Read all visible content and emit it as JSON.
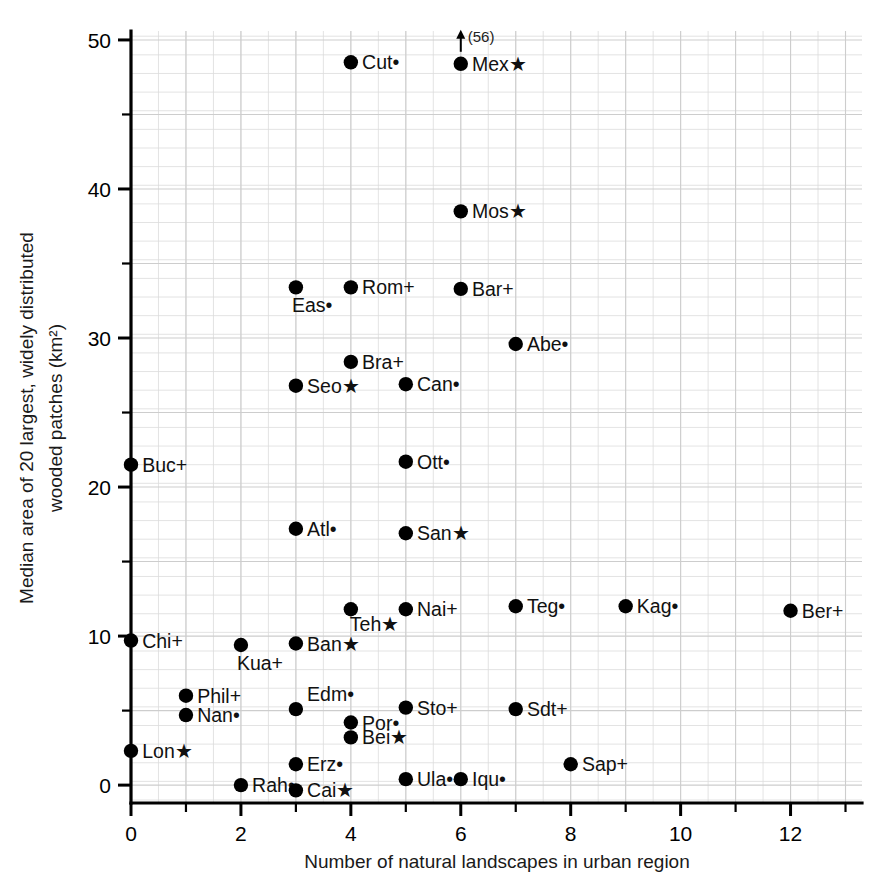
{
  "chart_data": {
    "type": "scatter",
    "title": "",
    "xlabel": "Number of natural landscapes in urban region",
    "ylabel": "Median area of 20 largest, widely distributed wooded patches (km²)",
    "xlim": [
      0,
      13.3
    ],
    "ylim": [
      -1.2,
      50.6
    ],
    "xticks": [
      0,
      2,
      4,
      6,
      8,
      10,
      12
    ],
    "xticklabels": [
      "0",
      "2",
      "4",
      "6",
      "8",
      "10",
      "12"
    ],
    "yticks": [
      0,
      10,
      20,
      30,
      40,
      50
    ],
    "yticklabels": [
      "0",
      "10",
      "20",
      "30",
      "40",
      "50"
    ],
    "x_minor_tick_step": 1,
    "y_minor_tick_step": 5,
    "grid": true,
    "grid_minor_step_x": 0.5,
    "grid_minor_step_y": 1.25,
    "legend": "none",
    "marker_style": "filled-circle",
    "points": [
      {
        "label": "Cut•",
        "x": 4,
        "y": 48.5,
        "label_side": "right"
      },
      {
        "label": "Mex★",
        "x": 6,
        "y": 48.4,
        "label_side": "right",
        "annotation": "(56)",
        "arrow": "up"
      },
      {
        "label": "Mos★",
        "x": 6,
        "y": 38.5,
        "label_side": "right"
      },
      {
        "label": "Eas•",
        "x": 3,
        "y": 33.4,
        "label_side": "below"
      },
      {
        "label": "Rom+",
        "x": 4,
        "y": 33.4,
        "label_side": "right"
      },
      {
        "label": "Bar+",
        "x": 6,
        "y": 33.3,
        "label_side": "right"
      },
      {
        "label": "Abe•",
        "x": 7,
        "y": 29.6,
        "label_side": "right"
      },
      {
        "label": "Bra+",
        "x": 4,
        "y": 28.4,
        "label_side": "right"
      },
      {
        "label": "Seo★",
        "x": 3,
        "y": 26.8,
        "label_side": "right"
      },
      {
        "label": "Can•",
        "x": 5,
        "y": 26.9,
        "label_side": "right"
      },
      {
        "label": "Buc+",
        "x": 0,
        "y": 21.5,
        "label_side": "right"
      },
      {
        "label": "Ott•",
        "x": 5,
        "y": 21.7,
        "label_side": "right"
      },
      {
        "label": "Atl•",
        "x": 3,
        "y": 17.2,
        "label_side": "right"
      },
      {
        "label": "San★",
        "x": 5,
        "y": 16.9,
        "label_side": "right"
      },
      {
        "label": "Teh★",
        "x": 4,
        "y": 11.8,
        "label_side": "below-right"
      },
      {
        "label": "Nai+",
        "x": 5,
        "y": 11.8,
        "label_side": "right"
      },
      {
        "label": "Teg•",
        "x": 7,
        "y": 12.0,
        "label_side": "right"
      },
      {
        "label": "Kag•",
        "x": 9,
        "y": 12.0,
        "label_side": "right"
      },
      {
        "label": "Ber+",
        "x": 12,
        "y": 11.7,
        "label_side": "right"
      },
      {
        "label": "Chi+",
        "x": 0,
        "y": 9.7,
        "label_side": "right"
      },
      {
        "label": "Kua+",
        "x": 2,
        "y": 9.4,
        "label_side": "below"
      },
      {
        "label": "Ban★",
        "x": 3,
        "y": 9.5,
        "label_side": "right"
      },
      {
        "label": "Phil+",
        "x": 1,
        "y": 6.0,
        "label_side": "right"
      },
      {
        "label": "Edm•",
        "x": 3,
        "y": 5.1,
        "label_side": "right-above"
      },
      {
        "label": "Sto+",
        "x": 5,
        "y": 5.2,
        "label_side": "right"
      },
      {
        "label": "Sdt+",
        "x": 7,
        "y": 5.1,
        "label_side": "right"
      },
      {
        "label": "Nan•",
        "x": 1,
        "y": 4.7,
        "label_side": "right"
      },
      {
        "label": "Por•",
        "x": 4,
        "y": 4.2,
        "label_side": "right"
      },
      {
        "label": "Bei★",
        "x": 4,
        "y": 3.2,
        "label_side": "right"
      },
      {
        "label": "Lon★",
        "x": 0,
        "y": 2.3,
        "label_side": "right"
      },
      {
        "label": "Sap+",
        "x": 8,
        "y": 1.4,
        "label_side": "right"
      },
      {
        "label": "Erz•",
        "x": 3,
        "y": 1.4,
        "label_side": "right"
      },
      {
        "label": "Ula•",
        "x": 5,
        "y": 0.4,
        "label_side": "right"
      },
      {
        "label": "Iqu•",
        "x": 6,
        "y": 0.4,
        "label_side": "right"
      },
      {
        "label": "Rah•",
        "x": 2,
        "y": 0.0,
        "label_side": "right"
      },
      {
        "label": "Cai★",
        "x": 3,
        "y": -0.35,
        "label_side": "right"
      }
    ]
  },
  "style": {
    "marker_color": "#000000",
    "grid_color": "#d8d8d8",
    "axis_color": "#000000",
    "background": "#ffffff"
  }
}
